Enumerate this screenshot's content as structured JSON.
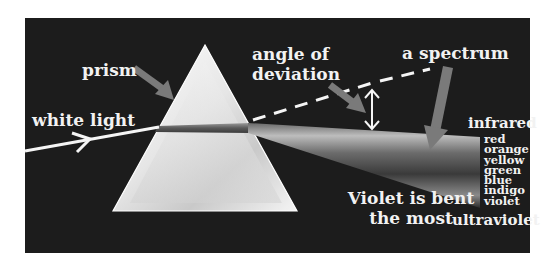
{
  "diagram": {
    "labels": {
      "prism": "prism",
      "white_light": "white light",
      "angle_line1": "angle of",
      "angle_line2": "deviation",
      "spectrum": "a spectrum",
      "infrared": "infrared",
      "violet_line1": "Violet is bent",
      "violet_line2": "the most",
      "ultraviolet": "ultraviolet"
    },
    "spectrum_colors": [
      "red",
      "orange",
      "yellow",
      "green",
      "blue",
      "indigo",
      "violet"
    ],
    "colors": {
      "background": "#1c1c1c",
      "text": "#f2f2f2",
      "pointer_arrow": "#7a7a7a",
      "ray": "#f5f5f5"
    }
  }
}
